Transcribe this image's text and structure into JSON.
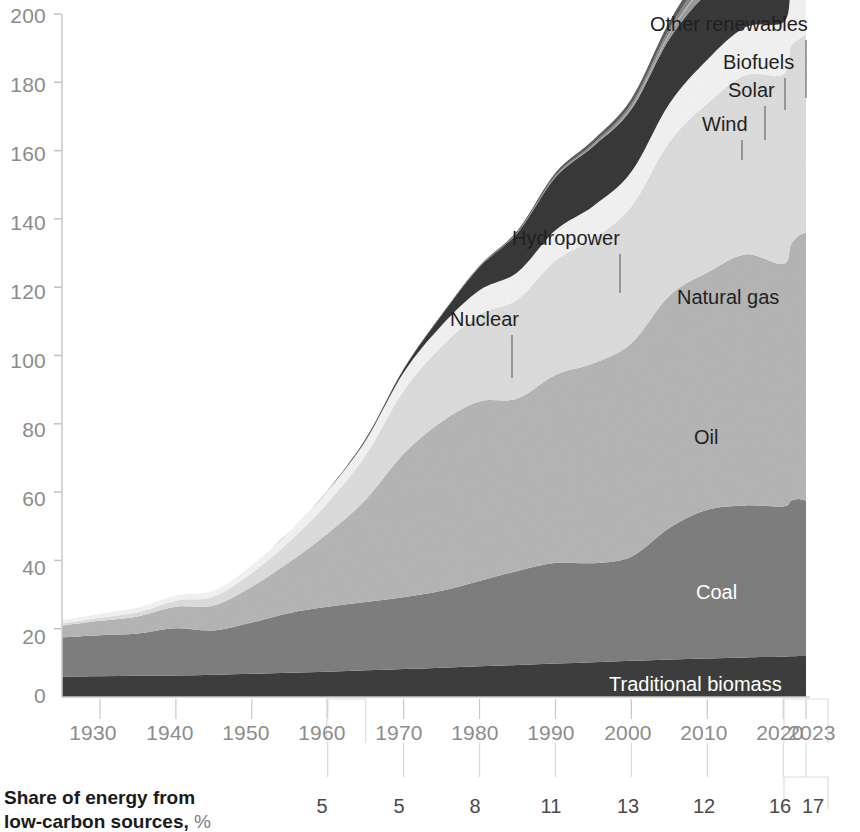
{
  "chart_data": {
    "type": "area",
    "title": "",
    "subtitle": "",
    "xlabel": "",
    "ylabel": "",
    "stacked": true,
    "grid": false,
    "legend_position": "inline-labels",
    "xlim": [
      1925,
      2023
    ],
    "ylim": [
      0,
      200
    ],
    "y_ticks": [
      0,
      20,
      40,
      60,
      80,
      100,
      120,
      140,
      160,
      180,
      200
    ],
    "x_ticks": [
      1930,
      1940,
      1950,
      1960,
      1970,
      1980,
      1990,
      2000,
      2010,
      2020,
      2023
    ],
    "x": [
      1925,
      1930,
      1935,
      1940,
      1945,
      1950,
      1955,
      1960,
      1965,
      1970,
      1975,
      1980,
      1985,
      1990,
      1995,
      2000,
      2005,
      2010,
      2015,
      2020,
      2021,
      2022,
      2023
    ],
    "series": [
      {
        "name": "Traditional biomass",
        "color": "#3d3d3d",
        "values": [
          6.0,
          6.1,
          6.2,
          6.3,
          6.5,
          6.8,
          7.1,
          7.4,
          7.8,
          8.2,
          8.6,
          9.0,
          9.4,
          9.8,
          10.2,
          10.6,
          11.0,
          11.3,
          11.6,
          11.8,
          11.9,
          12.0,
          12.0
        ]
      },
      {
        "name": "Coal",
        "color": "#7e7e7e",
        "values": [
          11.5,
          12.0,
          12.4,
          13.8,
          13.0,
          15.0,
          17.5,
          19.0,
          20.0,
          21.0,
          22.5,
          25.0,
          27.5,
          29.5,
          29.0,
          30.5,
          38.5,
          43.5,
          44.5,
          44.0,
          45.5,
          46.0,
          45.5
        ]
      },
      {
        "name": "Oil",
        "color": "#b5b5b5",
        "values": [
          3.4,
          4.2,
          5.0,
          6.3,
          7.3,
          10.5,
          15.0,
          21.5,
          30.0,
          42.0,
          49.5,
          52.5,
          50.5,
          55.0,
          58.5,
          62.5,
          68.0,
          69.5,
          73.5,
          71.0,
          75.0,
          77.0,
          78.5
        ]
      },
      {
        "name": "Natural gas",
        "color": "#dcdcdc",
        "values": [
          0.6,
          0.9,
          1.2,
          1.8,
          2.6,
          4.0,
          6.0,
          9.0,
          13.0,
          18.5,
          22.0,
          25.5,
          29.0,
          33.5,
          36.5,
          40.0,
          45.0,
          49.5,
          52.5,
          55.5,
          58.0,
          57.5,
          58.0
        ]
      },
      {
        "name": "Hydropower",
        "color": "#f2f2f2",
        "values": [
          1.0,
          1.2,
          1.4,
          1.6,
          1.8,
          2.3,
          2.9,
          3.5,
          4.3,
          5.3,
          6.2,
          7.1,
          8.0,
          8.9,
          9.6,
          10.2,
          11.2,
          12.8,
          14.0,
          15.2,
          15.5,
          15.6,
          15.9
        ]
      },
      {
        "name": "Nuclear",
        "color": "#383838",
        "values": [
          0.0,
          0.0,
          0.0,
          0.0,
          0.0,
          0.0,
          0.0,
          0.1,
          0.5,
          1.0,
          3.0,
          6.8,
          11.5,
          15.5,
          17.5,
          18.3,
          19.0,
          19.5,
          18.0,
          19.0,
          19.5,
          19.4,
          19.5
        ]
      },
      {
        "name": "Wind",
        "color": "#9a9a9a",
        "values": [
          0.0,
          0.0,
          0.0,
          0.0,
          0.0,
          0.0,
          0.0,
          0.0,
          0.0,
          0.0,
          0.0,
          0.0,
          0.0,
          0.1,
          0.2,
          0.6,
          1.4,
          3.4,
          7.2,
          13.5,
          15.5,
          17.5,
          19.0
        ]
      },
      {
        "name": "Solar",
        "color": "#cfcfcf",
        "values": [
          0.0,
          0.0,
          0.0,
          0.0,
          0.0,
          0.0,
          0.0,
          0.0,
          0.0,
          0.0,
          0.0,
          0.0,
          0.0,
          0.0,
          0.0,
          0.1,
          0.2,
          0.6,
          2.4,
          7.5,
          9.5,
          11.5,
          13.5
        ]
      },
      {
        "name": "Biofuels",
        "color": "#8a8a8a",
        "values": [
          0.0,
          0.0,
          0.0,
          0.0,
          0.0,
          0.0,
          0.0,
          0.0,
          0.0,
          0.0,
          0.0,
          0.1,
          0.2,
          0.4,
          0.6,
          0.9,
          1.4,
          2.4,
          2.9,
          2.9,
          3.2,
          3.4,
          3.5
        ]
      },
      {
        "name": "Other renewables",
        "color": "#5e5e5e",
        "values": [
          0.0,
          0.0,
          0.0,
          0.0,
          0.0,
          0.0,
          0.0,
          0.0,
          0.0,
          0.1,
          0.2,
          0.3,
          0.5,
          0.8,
          1.1,
          1.5,
          2.0,
          2.6,
          3.3,
          3.8,
          4.0,
          4.1,
          4.2
        ]
      }
    ],
    "annotations": {
      "low_carbon_row_label_line1": "Share of energy from",
      "low_carbon_row_label_line2": "low-carbon sources,",
      "low_carbon_row_label_unit": "%",
      "low_carbon_values": [
        {
          "year": 1960,
          "value": "5"
        },
        {
          "year": 1970,
          "value": "5"
        },
        {
          "year": 1980,
          "value": "8"
        },
        {
          "year": 1990,
          "value": "11"
        },
        {
          "year": 2000,
          "value": "13"
        },
        {
          "year": 2010,
          "value": "12"
        },
        {
          "year": 2020,
          "value": "16"
        },
        {
          "year": 2023,
          "value": "17"
        }
      ]
    }
  },
  "axis": {
    "y_tick_labels": [
      "200",
      "180",
      "160",
      "140",
      "120",
      "100",
      "80",
      "60",
      "40",
      "20",
      "0"
    ],
    "x_tick_labels": [
      "1930",
      "1940",
      "1950",
      "1960",
      "1970",
      "1980",
      "1990",
      "2000",
      "2010",
      "2020",
      "2023"
    ]
  },
  "series_labels": [
    {
      "name": "Other renewables",
      "text": "Other renewables"
    },
    {
      "name": "Biofuels",
      "text": "Biofuels"
    },
    {
      "name": "Solar",
      "text": "Solar"
    },
    {
      "name": "Wind",
      "text": "Wind"
    },
    {
      "name": "Hydropower",
      "text": "Hydropower"
    },
    {
      "name": "Nuclear",
      "text": "Nuclear"
    },
    {
      "name": "Natural gas",
      "text": "Natural gas"
    },
    {
      "name": "Oil",
      "text": "Oil"
    },
    {
      "name": "Coal",
      "text": "Coal"
    },
    {
      "name": "Traditional biomass",
      "text": "Traditional biomass"
    }
  ],
  "colors": {
    "axis_text": "#8c8c8c",
    "axis_line": "#c9c9c9",
    "label_text": "#1f1f1f",
    "label_text_light": "#ffffff",
    "footer_text": "#1a1a1a"
  }
}
